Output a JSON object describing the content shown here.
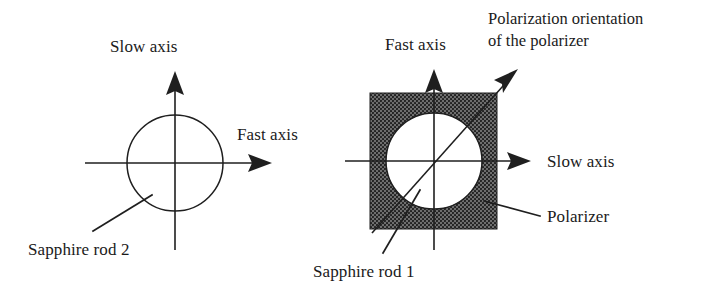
{
  "figure": {
    "background_color": "#ffffff",
    "ink_color": "#1f1f1f",
    "polarizer_fill_color": "#6e6e6e"
  },
  "left_diagram": {
    "name": "sapphire-rod-2-orientation",
    "vertical_axis_label": "Slow axis",
    "horizontal_axis_label": "Fast axis",
    "component_label": "Sapphire rod 2",
    "rod_shape": "circle"
  },
  "right_diagram": {
    "name": "sapphire-rod-1-with-polarizer-orientation",
    "vertical_axis_label": "Fast axis",
    "horizontal_axis_label": "Slow axis",
    "component_label": "Sapphire rod 1",
    "polarizer_label": "Polarizer",
    "polarization_label_line1": "Polarization orientation",
    "polarization_label_line2": "of  the polarizer",
    "rod_shape": "circle",
    "polarizer_shape": "square"
  }
}
